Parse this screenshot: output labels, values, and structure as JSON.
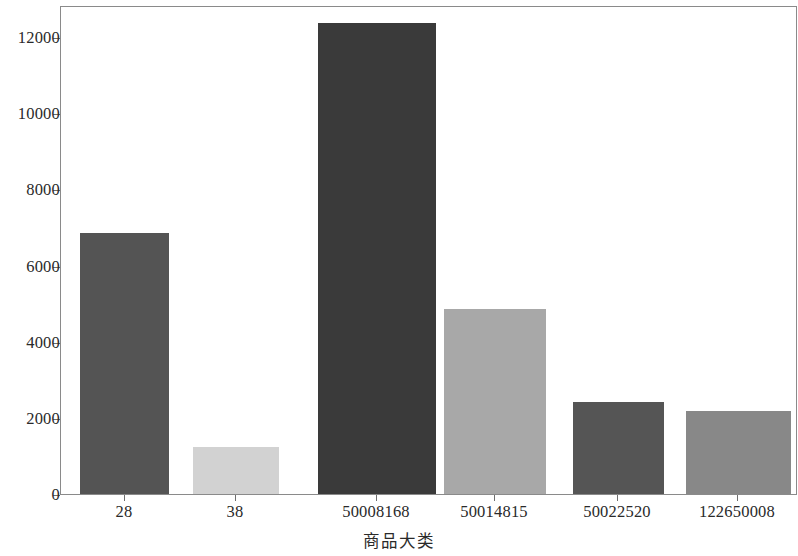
{
  "chart_data": {
    "type": "bar",
    "title": "",
    "subtitle": "",
    "xlabel": "商品大类",
    "ylabel": "",
    "categories": [
      "28",
      "38",
      "50008168",
      "50014815",
      "50022520",
      "122650008"
    ],
    "values": [
      6950,
      1220,
      12350,
      4850,
      2400,
      2150
    ],
    "series": [
      {
        "name": "商品大类",
        "values": [
          6950,
          1220,
          12350,
          4850,
          2400,
          2150
        ]
      }
    ],
    "bar_colors": [
      "#545454",
      "#d2d2d2",
      "#3a3a3a",
      "#a8a8a8",
      "#555555",
      "#888888"
    ],
    "ylim": [
      0,
      12840
    ],
    "xlim": [
      0,
      6
    ],
    "y_ticks": [
      0,
      2000,
      4000,
      6000,
      8000,
      10000,
      12000
    ],
    "y_tick_labels": [
      "0",
      "2000",
      "4000",
      "6000",
      "8000",
      "10000",
      "12000"
    ],
    "x_tick_labels": [
      "28",
      "38",
      "50008168",
      "50014815",
      "50022520",
      "122650008"
    ],
    "grid": false,
    "legend": null,
    "legend_position": "none",
    "frame": true,
    "background_color": "#ffffff",
    "axis_color": "#8a8a8a",
    "text_color": "#2a2a2a",
    "annotations": []
  },
  "bars": [
    {
      "label": "28",
      "value": 6950,
      "color": "#545454",
      "left_px": 79,
      "width_px": 89,
      "top_px": 229
    },
    {
      "label": "38",
      "value": 1220,
      "color": "#d2d2d2",
      "left_px": 192,
      "width_px": 86,
      "top_px": 443
    },
    {
      "label": "50008168",
      "value": 12350,
      "color": "#3a3a3a",
      "left_px": 317,
      "width_px": 118,
      "top_px": 19
    },
    {
      "label": "50014815",
      "value": 4850,
      "color": "#a8a8a8",
      "left_px": 443,
      "width_px": 102,
      "top_px": 305
    },
    {
      "label": "50022520",
      "value": 2400,
      "color": "#555555",
      "left_px": 572,
      "width_px": 91,
      "top_px": 398
    },
    {
      "label": "122650008",
      "value": 2150,
      "color": "#888888",
      "left_px": 685,
      "width_px": 105,
      "top_px": 407
    }
  ],
  "y_axis": {
    "ticks": [
      {
        "label": "12000",
        "y_px": 38
      },
      {
        "label": "10000",
        "y_px": 114
      },
      {
        "label": "8000",
        "y_px": 190
      },
      {
        "label": "6000",
        "y_px": 267
      },
      {
        "label": "4000",
        "y_px": 343
      },
      {
        "label": "2000",
        "y_px": 419
      },
      {
        "label": "0",
        "y_px": 495
      }
    ]
  },
  "x_axis": {
    "title": "商品大类",
    "ticks": [
      {
        "label": "28",
        "x_px": 124
      },
      {
        "label": "38",
        "x_px": 235
      },
      {
        "label": "50008168",
        "x_px": 376
      },
      {
        "label": "50014815",
        "x_px": 494
      },
      {
        "label": "50022520",
        "x_px": 617
      },
      {
        "label": "122650008",
        "x_px": 737
      }
    ]
  }
}
